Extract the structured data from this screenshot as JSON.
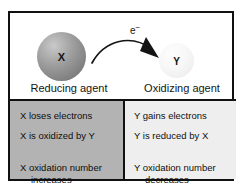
{
  "figure": {
    "colors": {
      "frame": "#111111",
      "left_cell_background": "#b3b3b3",
      "right_cell_background": "#eeeeee",
      "sphere_x": "#8a8a8a",
      "sphere_y": "#f2f2f2",
      "text": "#141414",
      "page_background": "#ffffff"
    }
  },
  "diagram": {
    "electron_arrow": {
      "label": "e",
      "charge": "−",
      "direction": "left-to-right"
    },
    "species": [
      {
        "symbol": "X",
        "caption": "Reducing agent",
        "shade": "dark-gray"
      },
      {
        "symbol": "Y",
        "caption": "Oxidizing agent",
        "shade": "light-gray"
      }
    ]
  },
  "table": {
    "left": {
      "lines": [
        "X loses electrons",
        "X is oxidized by Y"
      ],
      "wrapped": {
        "first": "X oxidation number",
        "second": "increases"
      }
    },
    "right": {
      "lines": [
        "Y gains electrons",
        "Y is reduced by X"
      ],
      "wrapped": {
        "first": "Y oxidation number",
        "second": "decreases"
      }
    }
  }
}
